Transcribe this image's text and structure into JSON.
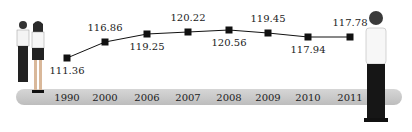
{
  "chart_data": {
    "type": "line",
    "title": "",
    "xlabel": "",
    "ylabel": "",
    "categories": [
      "1990",
      "2000",
      "2006",
      "2007",
      "2008",
      "2009",
      "2010",
      "2011"
    ],
    "values": [
      111.36,
      116.86,
      119.25,
      120.22,
      120.56,
      119.45,
      117.94,
      117.78
    ],
    "labels": [
      "111.36",
      "116.86",
      "119.25",
      "120.22",
      "120.56",
      "119.45",
      "117.94",
      "117.78"
    ],
    "label_positions": [
      "below",
      "above",
      "below",
      "above",
      "below",
      "above",
      "below",
      "above"
    ],
    "marker": "square",
    "grid": false,
    "legend": "none",
    "decorations": [
      "couple-illustration-left",
      "man-illustration-right"
    ]
  },
  "layout": {
    "xs": [
      67,
      105,
      147,
      188,
      229,
      268,
      308,
      350
    ],
    "ys": [
      58,
      42,
      34,
      32,
      30,
      33,
      37,
      37
    ]
  }
}
